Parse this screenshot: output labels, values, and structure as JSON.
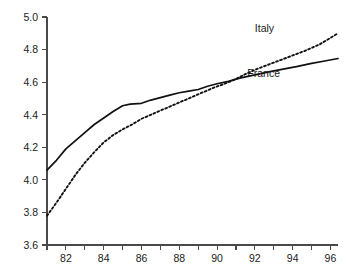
{
  "chart_data": {
    "type": "line",
    "title": "",
    "subtitle": "",
    "xlabel": "",
    "ylabel": "",
    "xlim": [
      81,
      96.4
    ],
    "ylim": [
      3.6,
      5.0
    ],
    "grid": false,
    "legend_position": "inline-right",
    "x_ticks_major": [
      "82",
      "84",
      "86",
      "88",
      "90",
      "92",
      "94",
      "96"
    ],
    "x_ticks_major_values": [
      82,
      84,
      86,
      88,
      90,
      92,
      94,
      96
    ],
    "x_ticks_minor_values": [
      81,
      83,
      85,
      87,
      89,
      91,
      93,
      95
    ],
    "y_ticks": [
      "3.6",
      "3.8",
      "4.0",
      "4.2",
      "4.4",
      "4.6",
      "4.8",
      "5.0"
    ],
    "y_tick_values": [
      3.6,
      3.8,
      4.0,
      4.2,
      4.4,
      4.6,
      4.8,
      5.0
    ],
    "series": [
      {
        "name": "France",
        "style": "solid",
        "color": "#111111",
        "label": "France",
        "label_x": 91.6,
        "label_y": 4.63,
        "x": [
          81.0,
          81.5,
          82.0,
          82.4,
          83.0,
          83.5,
          84.0,
          84.5,
          85.0,
          85.4,
          86.0,
          86.5,
          87.0,
          87.5,
          88.0,
          88.5,
          89.0,
          89.5,
          90.0,
          90.6,
          91.2,
          92.0,
          92.8,
          93.5,
          94.2,
          95.0,
          95.7,
          96.4
        ],
        "y": [
          4.06,
          4.12,
          4.19,
          4.23,
          4.29,
          4.34,
          4.38,
          4.42,
          4.455,
          4.465,
          4.47,
          4.49,
          4.505,
          4.52,
          4.535,
          4.545,
          4.555,
          4.575,
          4.59,
          4.605,
          4.625,
          4.645,
          4.665,
          4.68,
          4.695,
          4.715,
          4.73,
          4.745
        ]
      },
      {
        "name": "Italy",
        "style": "dotted",
        "color": "#111111",
        "label": "Italy",
        "label_x": 92.0,
        "label_y": 4.905,
        "x": [
          81.0,
          81.5,
          82.0,
          82.5,
          83.0,
          83.5,
          84.0,
          84.5,
          85.0,
          85.5,
          86.0,
          86.6,
          87.2,
          88.0,
          88.6,
          89.2,
          89.8,
          90.4,
          91.0,
          91.6,
          92.2,
          93.0,
          93.8,
          94.6,
          95.4,
          96.4
        ],
        "y": [
          3.78,
          3.86,
          3.945,
          4.03,
          4.105,
          4.17,
          4.23,
          4.275,
          4.31,
          4.34,
          4.375,
          4.405,
          4.435,
          4.475,
          4.505,
          4.535,
          4.565,
          4.59,
          4.62,
          4.655,
          4.685,
          4.72,
          4.755,
          4.79,
          4.83,
          4.9
        ]
      }
    ]
  },
  "axes": {
    "y_axis_name": "value-axis",
    "x_axis_name": "year-axis"
  }
}
